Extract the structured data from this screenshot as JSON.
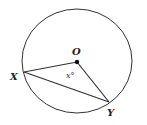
{
  "diagram": {
    "labels": {
      "center": "O",
      "point_x": "X",
      "point_y": "Y",
      "angle": "x°"
    },
    "colors": {
      "stroke": "#333333",
      "background": "#ffffff"
    }
  }
}
